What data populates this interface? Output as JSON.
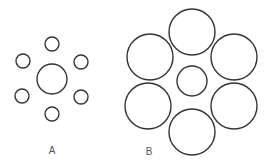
{
  "figure": {
    "stroke_color": "#333333",
    "background": "#ffffff",
    "panels": [
      {
        "label": "A",
        "label_pos": [
          52,
          154
        ],
        "center_circle": {
          "cx": 52,
          "cy": 79,
          "r": 15
        },
        "surround_circles": [
          {
            "cx": 52,
            "cy": 44,
            "r": 7
          },
          {
            "cx": 81,
            "cy": 62,
            "r": 7
          },
          {
            "cx": 81,
            "cy": 97,
            "r": 7
          },
          {
            "cx": 52,
            "cy": 114,
            "r": 7
          },
          {
            "cx": 22,
            "cy": 96,
            "r": 7
          },
          {
            "cx": 23,
            "cy": 61,
            "r": 7
          }
        ]
      },
      {
        "label": "B",
        "label_pos": [
          149,
          155
        ],
        "center_circle": {
          "cx": 192,
          "cy": 81,
          "r": 15
        },
        "surround_circles": [
          {
            "cx": 192,
            "cy": 32,
            "r": 23
          },
          {
            "cx": 234,
            "cy": 57,
            "r": 23
          },
          {
            "cx": 234,
            "cy": 106,
            "r": 23
          },
          {
            "cx": 192,
            "cy": 132,
            "r": 23
          },
          {
            "cx": 148,
            "cy": 106,
            "r": 23
          },
          {
            "cx": 150,
            "cy": 57,
            "r": 23
          }
        ]
      }
    ]
  }
}
